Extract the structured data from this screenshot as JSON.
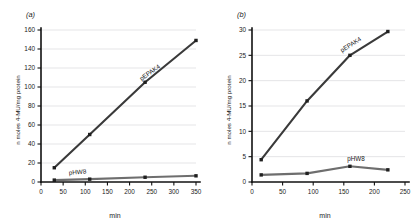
{
  "figure": {
    "panels": [
      {
        "label": "(a)",
        "x_axis_title": "min",
        "y_axis_title": "n moles 4-MU/mg protein"
      },
      {
        "label": "(b)",
        "x_axis_title": "min",
        "y_axis_title": "n moles 4-MU/mg protein"
      }
    ]
  },
  "chart_data": [
    {
      "type": "line",
      "title": "(a)",
      "xlabel": "min",
      "ylabel": "n moles 4-MU/mg protein",
      "xlim": [
        0,
        350
      ],
      "ylim": [
        0,
        160
      ],
      "xticks": [
        0,
        50,
        100,
        150,
        200,
        250,
        300,
        350
      ],
      "yticks": [
        0,
        20,
        40,
        60,
        80,
        100,
        120,
        140,
        160
      ],
      "grid": "horizontal",
      "legend": "inline-labels",
      "series": [
        {
          "name": "pEPAK4",
          "color": "#3a3a3a",
          "x": [
            30,
            110,
            235,
            350
          ],
          "values": [
            15,
            50,
            105,
            149
          ]
        },
        {
          "name": "pHW8",
          "color": "#6e6e6e",
          "x": [
            30,
            110,
            235,
            350
          ],
          "values": [
            2,
            3,
            5,
            6.5
          ]
        }
      ]
    },
    {
      "type": "line",
      "title": "(b)",
      "xlabel": "min",
      "ylabel": "n moles 4-MU/mg protein",
      "xlim": [
        0,
        250
      ],
      "ylim": [
        0,
        30
      ],
      "xticks": [
        0,
        50,
        100,
        150,
        200,
        250
      ],
      "yticks": [
        0,
        5,
        10,
        15,
        20,
        25,
        30
      ],
      "grid": "horizontal",
      "legend": "inline-labels",
      "series": [
        {
          "name": "pEPAK4",
          "color": "#3a3a3a",
          "x": [
            15,
            90,
            160,
            222
          ],
          "values": [
            4.4,
            16,
            25,
            29.7
          ]
        },
        {
          "name": "pHW8",
          "color": "#6e6e6e",
          "x": [
            15,
            90,
            160,
            222
          ],
          "values": [
            1.4,
            1.7,
            3.1,
            2.4
          ]
        }
      ]
    }
  ]
}
